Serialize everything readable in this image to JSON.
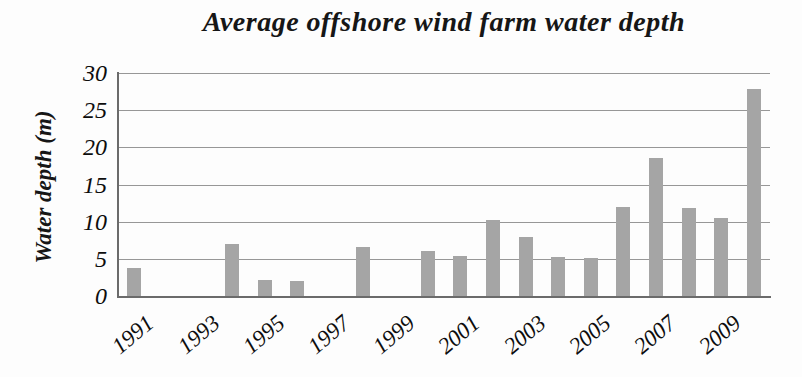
{
  "title": "Average offshore wind farm water depth",
  "colors": {
    "bar": "#a5a5a5",
    "gridline": "#979797",
    "axis": "#6b6b6b",
    "text": "#111111",
    "background": "#fdfdfd"
  },
  "chart_data": {
    "type": "bar",
    "title": "Average offshore wind farm water depth",
    "xlabel": "",
    "ylabel": "Water depth (m)",
    "ylim": [
      0,
      30
    ],
    "ytick_step": 5,
    "yticks": [
      0,
      5,
      10,
      15,
      20,
      25,
      30
    ],
    "grid": true,
    "legend": false,
    "categories": [
      1991,
      1992,
      1993,
      1994,
      1995,
      1996,
      1997,
      1998,
      1999,
      2000,
      2001,
      2002,
      2003,
      2004,
      2005,
      2006,
      2007,
      2008,
      2009,
      2010
    ],
    "values": [
      3.8,
      0,
      0,
      7.0,
      2.2,
      2.0,
      0,
      6.6,
      0,
      6.0,
      5.4,
      10.2,
      8.0,
      5.3,
      5.1,
      12.0,
      18.6,
      11.8,
      10.5,
      27.8
    ],
    "x_tick_labels": [
      "1991",
      "1993",
      "1995",
      "1997",
      "1999",
      "2001",
      "2003",
      "2005",
      "2007",
      "2009"
    ],
    "x_tick_indices": [
      0,
      2,
      4,
      6,
      8,
      10,
      12,
      14,
      16,
      18
    ]
  }
}
